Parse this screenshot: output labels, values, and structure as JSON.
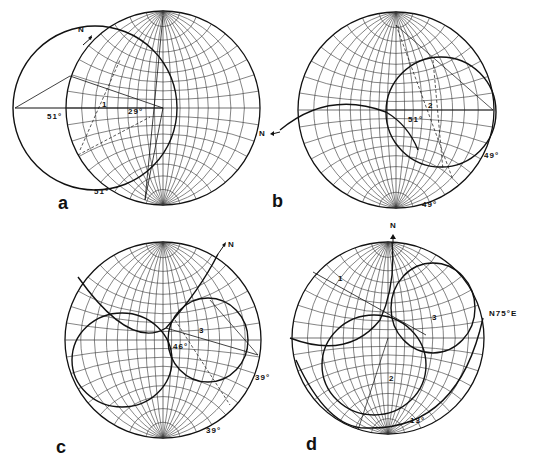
{
  "figure": {
    "panels": [
      {
        "id": "a",
        "letter": "a",
        "north": "N",
        "labels": {
          "angle_left": "51°",
          "angle_center": "29°",
          "angle_bottom": "51°"
        },
        "points": [
          "1"
        ]
      },
      {
        "id": "b",
        "letter": "b",
        "north": "N",
        "labels": {
          "angle_center": "51°",
          "angle_right": "49°",
          "angle_bottom": "49°"
        },
        "points": [
          "2"
        ]
      },
      {
        "id": "c",
        "letter": "c",
        "north": "N",
        "labels": {
          "angle_center": "46°",
          "angle_right": "39°",
          "angle_bottom": "39°"
        },
        "points": [
          "3"
        ]
      },
      {
        "id": "d",
        "letter": "d",
        "north": "N",
        "labels": {
          "azimuth": "N75°E",
          "angle_bottom": "13°"
        },
        "points": [
          "1",
          "2",
          "3"
        ]
      }
    ]
  },
  "colors": {
    "ink": "#111111",
    "grid": "#333333",
    "background": "#ffffff"
  }
}
